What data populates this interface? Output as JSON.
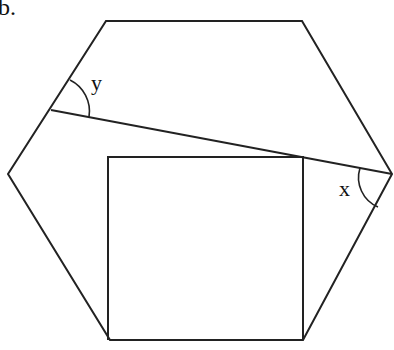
{
  "figure_label": "b.",
  "angles": {
    "x": "x",
    "y": "y"
  },
  "shapes": {
    "hexagon": [
      [
        106,
        21
      ],
      [
        302,
        21
      ],
      [
        392,
        174
      ],
      [
        303,
        340
      ],
      [
        110,
        340
      ],
      [
        8,
        174
      ]
    ],
    "transversal": [
      [
        51,
        110
      ],
      [
        392,
        174
      ]
    ],
    "square": [
      [
        108,
        157
      ],
      [
        303,
        157
      ],
      [
        303,
        340
      ],
      [
        108,
        340
      ]
    ]
  },
  "colors": {
    "stroke": "#222222",
    "background": "#ffffff"
  }
}
